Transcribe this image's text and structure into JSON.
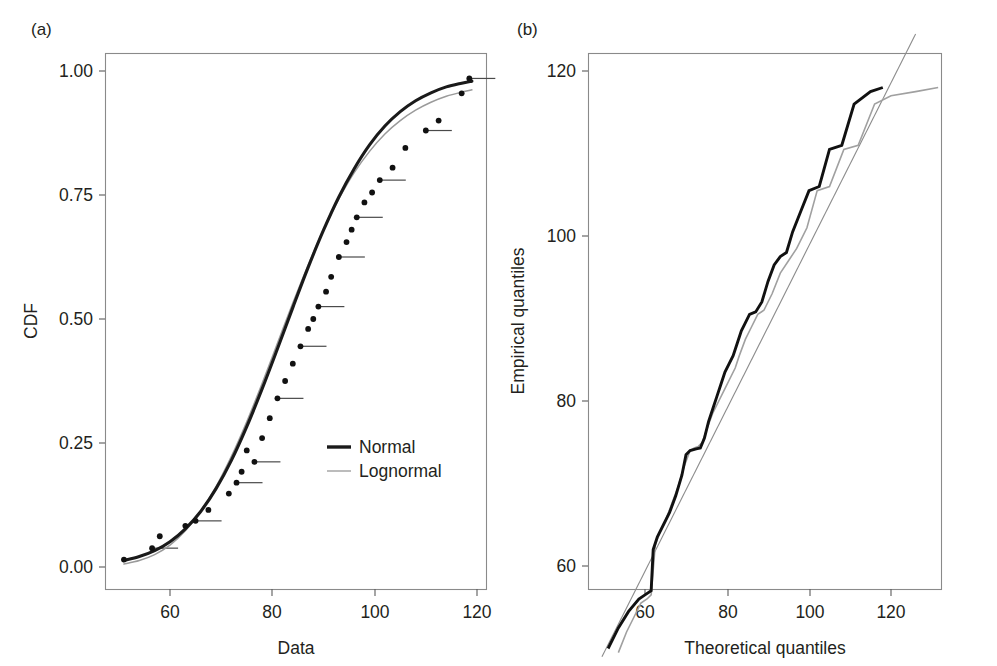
{
  "figure": {
    "background": "#ffffff",
    "width": 997,
    "height": 666
  },
  "panels": {
    "a": {
      "label": "(a)",
      "xlabel": "Data",
      "ylabel": "CDF"
    },
    "b": {
      "label": "(b)",
      "xlabel": "Theoretical quantiles",
      "ylabel": "Empirical quantiles"
    }
  },
  "legend": {
    "position": "inside-lower-right",
    "items": [
      {
        "label": "Normal",
        "color": "#1a1a1a",
        "style": "thick-solid"
      },
      {
        "label": "Lognormal",
        "color": "#a6a6a6",
        "style": "thin-solid"
      }
    ]
  },
  "chart_data": [
    {
      "id": "panel-a",
      "type": "line",
      "title": "(a)",
      "xlabel": "Data",
      "ylabel": "CDF",
      "xlim": [
        50,
        124
      ],
      "ylim": [
        -0.03,
        1.04
      ],
      "xticks": [
        60,
        80,
        100,
        120
      ],
      "xtick_labels": [
        "60",
        "80",
        "100",
        "120"
      ],
      "yticks": [
        0.0,
        0.25,
        0.5,
        0.75,
        1.0
      ],
      "ytick_labels": [
        "0.00",
        "0.25",
        "0.50",
        "0.75",
        "1.00"
      ],
      "grid": false,
      "legend": [
        "Normal",
        "Lognormal"
      ],
      "series": [
        {
          "name": "Normal",
          "kind": "fitted-cdf",
          "color": "#1a1a1a",
          "x": [
            51,
            54,
            57,
            60,
            63,
            66,
            69,
            72,
            75,
            78,
            81,
            84,
            87,
            90,
            93,
            96,
            99,
            102,
            105,
            108,
            111,
            114,
            117,
            119
          ],
          "y": [
            0.013,
            0.021,
            0.033,
            0.051,
            0.077,
            0.112,
            0.158,
            0.215,
            0.283,
            0.359,
            0.44,
            0.523,
            0.604,
            0.679,
            0.746,
            0.803,
            0.851,
            0.889,
            0.918,
            0.94,
            0.956,
            0.968,
            0.9755,
            0.9795
          ]
        },
        {
          "name": "Lognormal",
          "kind": "fitted-cdf",
          "color": "#9a9a9a",
          "x": [
            51,
            54,
            57,
            60,
            63,
            66,
            69,
            72,
            75,
            78,
            81,
            84,
            87,
            90,
            93,
            96,
            99,
            102,
            105,
            108,
            111,
            114,
            117,
            119
          ],
          "y": [
            0.006,
            0.013,
            0.025,
            0.044,
            0.073,
            0.112,
            0.162,
            0.223,
            0.293,
            0.37,
            0.451,
            0.532,
            0.609,
            0.68,
            0.742,
            0.795,
            0.838,
            0.873,
            0.9,
            0.921,
            0.937,
            0.949,
            0.9575,
            0.962
          ]
        },
        {
          "name": "Empirical CDF",
          "kind": "step-points",
          "color": "#111111",
          "x": [
            51.0,
            56.5,
            58.0,
            63.0,
            65.0,
            67.5,
            71.5,
            73.0,
            74.0,
            75.0,
            76.5,
            78.0,
            79.5,
            81.0,
            82.5,
            84.0,
            85.5,
            87.0,
            88.0,
            89.0,
            90.5,
            91.5,
            93.0,
            94.5,
            95.5,
            96.5,
            98.0,
            99.5,
            101.0,
            103.5,
            106.0,
            110.0,
            112.5,
            117.0,
            118.5
          ],
          "y": [
            0.015,
            0.038,
            0.062,
            0.083,
            0.093,
            0.115,
            0.148,
            0.17,
            0.192,
            0.235,
            0.212,
            0.26,
            0.3,
            0.34,
            0.375,
            0.41,
            0.445,
            0.48,
            0.5,
            0.525,
            0.555,
            0.585,
            0.625,
            0.655,
            0.68,
            0.705,
            0.735,
            0.755,
            0.78,
            0.805,
            0.845,
            0.88,
            0.9,
            0.955,
            0.985
          ]
        }
      ]
    },
    {
      "id": "panel-b",
      "type": "line",
      "title": "(b)",
      "xlabel": "Theoretical quantiles",
      "ylabel": "Empirical quantiles",
      "xlim": [
        48,
        136
      ],
      "ylim": [
        48,
        124
      ],
      "xticks": [
        60,
        80,
        100,
        120
      ],
      "xtick_labels": [
        "60",
        "80",
        "100",
        "120"
      ],
      "yticks": [
        60,
        80,
        100,
        120
      ],
      "ytick_labels": [
        "60",
        "80",
        "100",
        "120"
      ],
      "grid": false,
      "series": [
        {
          "name": "Reference line",
          "kind": "identity-line",
          "color": "#8c8c8c",
          "x": [
            49.5,
            126.0
          ],
          "y": [
            49.0,
            124.5
          ]
        },
        {
          "name": "Normal",
          "kind": "qq-step",
          "color": "#111111",
          "x": [
            51.0,
            53.5,
            56.0,
            58.5,
            60.0,
            61.5,
            62.0,
            63.0,
            64.5,
            66.0,
            67.5,
            69.0,
            70.0,
            71.0,
            72.5,
            73.5,
            74.5,
            75.5,
            76.5,
            77.5,
            78.5,
            79.5,
            80.5,
            81.5,
            82.5,
            83.5,
            84.5,
            85.5,
            87.0,
            88.5,
            90.0,
            91.5,
            93.0,
            94.5,
            96.0,
            98.0,
            100.0,
            102.5,
            105.0,
            108.0,
            111.0,
            115.0,
            118.0
          ],
          "y": [
            50.0,
            52.5,
            54.5,
            56.0,
            56.5,
            57.0,
            62.0,
            63.5,
            65.0,
            66.5,
            68.5,
            71.0,
            73.5,
            74.0,
            74.2,
            74.3,
            75.5,
            77.5,
            79.0,
            80.5,
            82.0,
            83.5,
            84.5,
            85.5,
            87.0,
            88.5,
            89.5,
            90.5,
            90.8,
            92.0,
            94.5,
            96.5,
            97.5,
            98.0,
            100.5,
            103.0,
            105.5,
            106.0,
            110.5,
            111.0,
            116.0,
            117.5,
            118.0
          ]
        },
        {
          "name": "Lognormal",
          "kind": "qq-step",
          "color": "#a0a0a0",
          "x": [
            53.5,
            55.5,
            57.5,
            59.0,
            60.5,
            61.5,
            62.5,
            63.5,
            65.0,
            66.5,
            68.0,
            69.5,
            71.0,
            72.0,
            73.0,
            74.0,
            75.0,
            76.5,
            78.0,
            79.5,
            81.0,
            82.0,
            83.0,
            84.5,
            86.0,
            87.5,
            89.0,
            91.0,
            93.0,
            95.0,
            97.0,
            99.5,
            102.0,
            105.0,
            108.5,
            112.0,
            116.0,
            120.0,
            126.0,
            131.5
          ],
          "y": [
            49.5,
            52.0,
            54.0,
            55.5,
            56.0,
            56.5,
            62.5,
            64.0,
            65.5,
            67.5,
            69.5,
            72.0,
            74.0,
            74.3,
            74.5,
            75.0,
            76.5,
            78.5,
            80.0,
            81.5,
            83.0,
            84.0,
            85.5,
            87.5,
            89.0,
            90.5,
            91.0,
            93.0,
            95.5,
            97.0,
            98.5,
            101.0,
            105.5,
            106.0,
            110.5,
            111.0,
            116.0,
            117.0,
            117.5,
            118.0
          ]
        }
      ]
    }
  ]
}
